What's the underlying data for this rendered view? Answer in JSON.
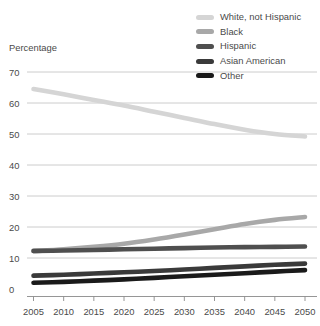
{
  "chart_data": {
    "type": "line",
    "title": "",
    "ylabel": "Percentage",
    "xlabel": "",
    "ylim": [
      0,
      70
    ],
    "xlim": [
      2005,
      2050
    ],
    "grid": true,
    "legend_position": "top-right",
    "x": [
      2005,
      2010,
      2015,
      2020,
      2025,
      2030,
      2035,
      2040,
      2045,
      2050
    ],
    "xticklabels": [
      "2005",
      "2010",
      "2015",
      "2020",
      "2025",
      "2030",
      "2035",
      "2040",
      "2045",
      "2050"
    ],
    "yticklabels": [
      "0",
      "10",
      "20",
      "30",
      "40",
      "50",
      "60",
      "70"
    ],
    "yticks": [
      0,
      10,
      20,
      30,
      40,
      50,
      60,
      70
    ],
    "series": [
      {
        "name": "White, not Hispanic",
        "color": "#d5d5d5",
        "values": [
          64.5,
          62.8,
          61.0,
          59.2,
          57.2,
          55.2,
          53.2,
          51.4,
          50.0,
          49.2
        ]
      },
      {
        "name": "Black",
        "color": "#a8a8a8",
        "values": [
          12.2,
          12.8,
          13.6,
          14.6,
          16.0,
          17.6,
          19.3,
          21.0,
          22.3,
          23.2
        ]
      },
      {
        "name": "Hispanic",
        "color": "#4f4f4f",
        "values": [
          12.3,
          12.4,
          12.6,
          12.8,
          13.0,
          13.2,
          13.4,
          13.5,
          13.6,
          13.7
        ]
      },
      {
        "name": "Asian American",
        "color": "#3a3a3a",
        "values": [
          4.3,
          4.6,
          5.0,
          5.4,
          5.8,
          6.3,
          6.8,
          7.3,
          7.8,
          8.2
        ]
      },
      {
        "name": "Other",
        "color": "#1a1a1a",
        "values": [
          2.0,
          2.3,
          2.7,
          3.1,
          3.6,
          4.1,
          4.6,
          5.1,
          5.6,
          6.1
        ]
      }
    ]
  },
  "legend": {
    "items": [
      {
        "label": "White, not Hispanic",
        "color": "#d5d5d5"
      },
      {
        "label": "Black",
        "color": "#a8a8a8"
      },
      {
        "label": "Hispanic",
        "color": "#4f4f4f"
      },
      {
        "label": "Asian American",
        "color": "#3a3a3a"
      },
      {
        "label": "Other",
        "color": "#1a1a1a"
      }
    ]
  },
  "axes": {
    "y_title": "Percentage",
    "y_ticks": [
      "70",
      "60",
      "50",
      "40",
      "30",
      "20",
      "10",
      "0"
    ],
    "x_ticks": [
      "2005",
      "2010",
      "2015",
      "2020",
      "2025",
      "2030",
      "2035",
      "2040",
      "2045",
      "2050"
    ]
  },
  "colors": {
    "gridline": "#bfbfbf",
    "axis": "#8a8a8a",
    "text": "#4a4a4a",
    "background": "#ffffff"
  }
}
